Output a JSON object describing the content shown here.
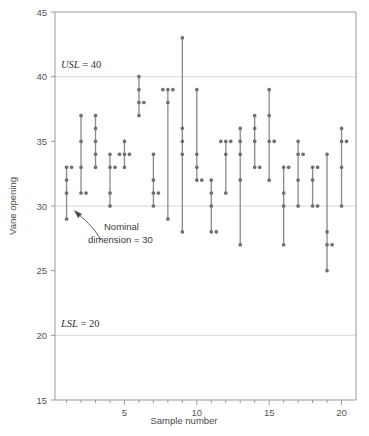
{
  "chart_data": {
    "type": "scatter",
    "title": "",
    "xlabel": "Sample number",
    "ylabel": "Vane opening",
    "xlim": [
      0.2,
      21.0
    ],
    "ylim": [
      15,
      45
    ],
    "ytick_labels": [
      "15",
      "20",
      "25",
      "30",
      "35",
      "40",
      "45"
    ],
    "yticks": [
      15,
      20,
      25,
      30,
      35,
      40,
      45
    ],
    "xtick_labels": [
      "5",
      "10",
      "15",
      "20"
    ],
    "xticks": [
      5,
      10,
      15,
      20
    ],
    "grid": "horizontal-major-only",
    "legend": "none",
    "marker_color": "#6f6f6f",
    "line_color": "#8a8a8a",
    "grid_color": "#d9d9d9",
    "axis_color": "#9a9a9a",
    "categories": [
      1,
      2,
      3,
      4,
      5,
      6,
      7,
      8,
      9,
      10,
      11,
      12,
      13,
      14,
      15,
      16,
      17,
      18,
      19,
      20
    ],
    "samples": [
      {
        "sample": 1,
        "values": [
          33,
          33,
          32,
          31,
          29
        ]
      },
      {
        "sample": 2,
        "values": [
          37,
          35,
          33,
          31,
          31
        ]
      },
      {
        "sample": 3,
        "values": [
          37,
          36,
          35,
          34,
          33
        ]
      },
      {
        "sample": 4,
        "values": [
          34,
          33,
          33,
          31,
          30
        ]
      },
      {
        "sample": 5,
        "values": [
          35,
          34,
          34,
          34,
          33
        ]
      },
      {
        "sample": 6,
        "values": [
          40,
          39,
          38,
          38,
          37
        ]
      },
      {
        "sample": 7,
        "values": [
          34,
          32,
          31,
          31,
          30
        ]
      },
      {
        "sample": 8,
        "values": [
          39,
          39,
          39,
          38,
          29
        ]
      },
      {
        "sample": 9,
        "values": [
          43,
          36,
          35,
          34,
          28
        ]
      },
      {
        "sample": 10,
        "values": [
          39,
          34,
          33,
          32,
          32
        ]
      },
      {
        "sample": 11,
        "values": [
          32,
          31,
          30,
          28,
          28
        ]
      },
      {
        "sample": 12,
        "values": [
          35,
          35,
          35,
          34,
          31
        ]
      },
      {
        "sample": 13,
        "values": [
          36,
          35,
          34,
          32,
          27
        ]
      },
      {
        "sample": 14,
        "values": [
          37,
          36,
          35,
          33,
          33
        ]
      },
      {
        "sample": 15,
        "values": [
          39,
          37,
          35,
          35,
          32
        ]
      },
      {
        "sample": 16,
        "values": [
          33,
          33,
          31,
          30,
          27
        ]
      },
      {
        "sample": 17,
        "values": [
          35,
          34,
          34,
          32,
          30
        ]
      },
      {
        "sample": 18,
        "values": [
          33,
          33,
          32,
          30,
          30
        ]
      },
      {
        "sample": 19,
        "values": [
          34,
          28,
          27,
          27,
          25
        ]
      },
      {
        "sample": 20,
        "values": [
          36,
          35,
          35,
          33,
          30
        ]
      }
    ],
    "reference_lines": [
      {
        "name": "usl",
        "value": 40,
        "label": "USL = 40",
        "label_italic": "USL",
        "label_rest": " = 40"
      },
      {
        "name": "nominal",
        "value": 30,
        "label": "Nominal dimension = 30"
      },
      {
        "name": "lsl",
        "value": 20,
        "label": "LSL = 20",
        "label_italic": "LSL",
        "label_rest": " = 20"
      }
    ],
    "annotations": [
      {
        "name": "nominal-annotation",
        "line1": "Nominal",
        "line2": "dimension = 30"
      }
    ]
  }
}
